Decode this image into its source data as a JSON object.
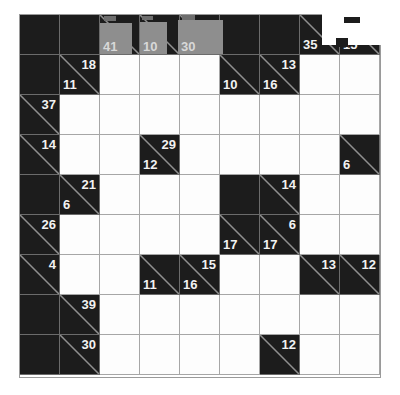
{
  "puzzle": {
    "kind": "kakuro",
    "rows": 9,
    "cols": 9,
    "cell_size": 40,
    "origin_x": 19,
    "origin_y": 14,
    "colors": {
      "block": "#1c1c1c",
      "entry": "#fdfdfd",
      "grid_line": "#a6a6a6",
      "clue_text": "#f2f2f2",
      "highlight": "#8e8e8e",
      "overlay": "#ffffff"
    },
    "cells": [
      [
        {
          "type": "block"
        },
        {
          "type": "block"
        },
        {
          "type": "clue",
          "right": "41"
        },
        {
          "type": "clue",
          "right": "10"
        },
        {
          "type": "clue",
          "right": "30"
        },
        {
          "type": "block"
        },
        {
          "type": "block"
        },
        {
          "type": "clue",
          "right": "35"
        },
        {
          "type": "clue",
          "right": "15"
        }
      ],
      [
        {
          "type": "block"
        },
        {
          "type": "clue",
          "down": "18",
          "right": "11"
        },
        {
          "type": "entry"
        },
        {
          "type": "entry"
        },
        {
          "type": "entry"
        },
        {
          "type": "clue",
          "right": "10"
        },
        {
          "type": "clue",
          "down": "13",
          "right": "16"
        },
        {
          "type": "entry"
        },
        {
          "type": "entry"
        }
      ],
      [
        {
          "type": "clue",
          "down": "37"
        },
        {
          "type": "entry"
        },
        {
          "type": "entry"
        },
        {
          "type": "entry"
        },
        {
          "type": "entry"
        },
        {
          "type": "entry"
        },
        {
          "type": "entry"
        },
        {
          "type": "entry"
        },
        {
          "type": "entry"
        }
      ],
      [
        {
          "type": "clue",
          "down": "14"
        },
        {
          "type": "entry"
        },
        {
          "type": "entry"
        },
        {
          "type": "clue",
          "down": "29",
          "right": "12"
        },
        {
          "type": "entry"
        },
        {
          "type": "entry"
        },
        {
          "type": "entry"
        },
        {
          "type": "entry"
        },
        {
          "type": "clue",
          "right": "6"
        }
      ],
      [
        {
          "type": "block"
        },
        {
          "type": "clue",
          "down": "21",
          "right": "6"
        },
        {
          "type": "entry"
        },
        {
          "type": "entry"
        },
        {
          "type": "entry"
        },
        {
          "type": "block"
        },
        {
          "type": "clue",
          "down": "14"
        },
        {
          "type": "entry"
        },
        {
          "type": "entry"
        }
      ],
      [
        {
          "type": "clue",
          "down": "26"
        },
        {
          "type": "entry"
        },
        {
          "type": "entry"
        },
        {
          "type": "entry"
        },
        {
          "type": "entry"
        },
        {
          "type": "clue",
          "right": "17"
        },
        {
          "type": "clue",
          "down": "6",
          "right": "17"
        },
        {
          "type": "entry"
        },
        {
          "type": "entry"
        }
      ],
      [
        {
          "type": "clue",
          "down": "4"
        },
        {
          "type": "entry"
        },
        {
          "type": "entry"
        },
        {
          "type": "clue",
          "right": "11"
        },
        {
          "type": "clue",
          "down": "15",
          "right": "16"
        },
        {
          "type": "entry"
        },
        {
          "type": "entry"
        },
        {
          "type": "clue",
          "down": "13"
        },
        {
          "type": "clue",
          "down": "12"
        }
      ],
      [
        {
          "type": "block"
        },
        {
          "type": "clue",
          "down": "39"
        },
        {
          "type": "entry"
        },
        {
          "type": "entry"
        },
        {
          "type": "entry"
        },
        {
          "type": "entry"
        },
        {
          "type": "entry"
        },
        {
          "type": "entry"
        },
        {
          "type": "entry"
        }
      ],
      [
        {
          "type": "block"
        },
        {
          "type": "clue",
          "down": "30"
        },
        {
          "type": "entry"
        },
        {
          "type": "entry"
        },
        {
          "type": "entry"
        },
        {
          "type": "entry"
        },
        {
          "type": "clue",
          "down": "12"
        },
        {
          "type": "entry"
        },
        {
          "type": "entry"
        }
      ]
    ],
    "highlights": [
      {
        "name": "highlight-col2",
        "x": 100,
        "y": 23,
        "w": 32,
        "h": 31,
        "label": "41"
      },
      {
        "name": "highlight-col3",
        "x": 140,
        "y": 22,
        "w": 27,
        "h": 32,
        "label": "10"
      },
      {
        "name": "highlight-col4",
        "x": 178,
        "y": 20,
        "w": 45,
        "h": 34,
        "label": "30"
      }
    ],
    "grey_notches": [
      {
        "x": 104,
        "y": 16,
        "w": 12,
        "h": 5
      },
      {
        "x": 142,
        "y": 16,
        "w": 11,
        "h": 4
      },
      {
        "x": 182,
        "y": 15,
        "w": 13,
        "h": 5
      }
    ],
    "overlays": [
      {
        "name": "white-overlay-topright",
        "x": 322,
        "y": 13,
        "w": 60,
        "h": 32
      }
    ],
    "dark_notches": [
      {
        "x": 344,
        "y": 17,
        "w": 16,
        "h": 6
      },
      {
        "x": 336,
        "y": 38,
        "w": 12,
        "h": 9
      }
    ]
  }
}
